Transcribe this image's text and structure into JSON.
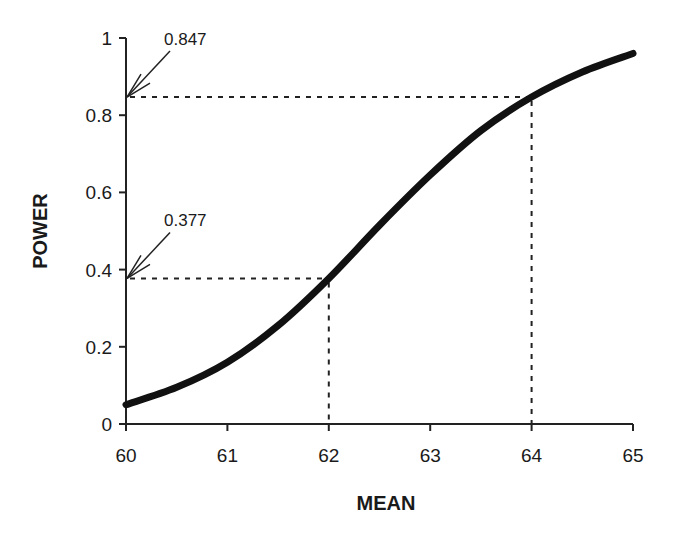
{
  "chart_data": {
    "type": "line",
    "title": "",
    "xlabel": "MEAN",
    "ylabel": "POWER",
    "xlim": [
      60,
      65
    ],
    "ylim": [
      0,
      1
    ],
    "x_ticks": [
      "60",
      "61",
      "62",
      "63",
      "64",
      "65"
    ],
    "y_ticks": [
      "0",
      "0.2",
      "0.4",
      "0.6",
      "0.8",
      "1"
    ],
    "grid": false,
    "legend": null,
    "series": [
      {
        "name": "Power curve",
        "x": [
          60,
          60.5,
          61,
          61.5,
          62,
          62.5,
          63,
          63.5,
          64,
          64.5,
          65
        ],
        "values": [
          0.05,
          0.095,
          0.16,
          0.255,
          0.377,
          0.515,
          0.645,
          0.76,
          0.847,
          0.912,
          0.96
        ]
      }
    ],
    "annotations": [
      {
        "text": "0.847",
        "x": 64,
        "y": 0.847,
        "arrow_to_axis": true
      },
      {
        "text": "0.377",
        "x": 62,
        "y": 0.377,
        "arrow_to_axis": true
      }
    ]
  }
}
